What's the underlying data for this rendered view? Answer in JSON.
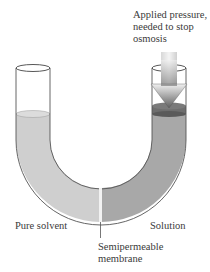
{
  "labels": {
    "pressure_line1": "Applied pressure,",
    "pressure_line2": "needed to stop",
    "pressure_line3": "osmosis",
    "pure_solvent": "Pure solvent",
    "solution": "Solution",
    "membrane_line1": "Semipermeable",
    "membrane_line2": "membrane"
  },
  "colors": {
    "pure_solvent_fill": "#cfcfcf",
    "solution_fill": "#a9a9a9",
    "piston": "#6e6e6e",
    "arrow_top": "#e8e8e8",
    "arrow_bottom": "#6a6a6a",
    "glass_outline": "#555555",
    "membrane": "#f2f2f2"
  },
  "icons": {
    "arrow": "down-arrow-icon"
  }
}
